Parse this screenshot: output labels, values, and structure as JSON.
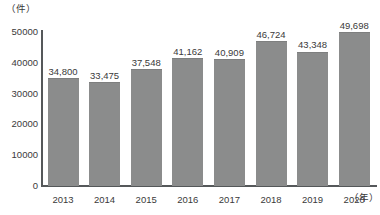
{
  "chart_data": {
    "type": "bar",
    "title": "",
    "subtitle": "",
    "xlabel": "（年）",
    "ylabel": "（件）",
    "categories": [
      "2013",
      "2014",
      "2015",
      "2016",
      "2017",
      "2018",
      "2019",
      "2020"
    ],
    "values": [
      34800,
      33475,
      37548,
      41162,
      40909,
      46724,
      43348,
      49698
    ],
    "data_labels": [
      "34,800",
      "33,475",
      "37,548",
      "41,162",
      "40,909",
      "46,724",
      "43,348",
      "49,698"
    ],
    "ylim": [
      0,
      50000
    ],
    "ytick_values": [
      50000,
      40000,
      30000,
      20000,
      10000,
      0
    ],
    "ytick_labels": [
      "50000",
      "40000",
      "30000",
      "20000",
      "10000",
      "0"
    ],
    "grid": false,
    "legend": null,
    "legend_position": "none",
    "series": [
      {
        "name": "",
        "values": [
          34800,
          33475,
          37548,
          41162,
          40909,
          46724,
          43348,
          49698
        ]
      }
    ],
    "colors": {
      "bar_fill": "#8b8c8c",
      "bar_edge": "#7e7f7f",
      "axis": "#55585a",
      "text": "#3a3a3a",
      "background": "#ffffff"
    }
  }
}
